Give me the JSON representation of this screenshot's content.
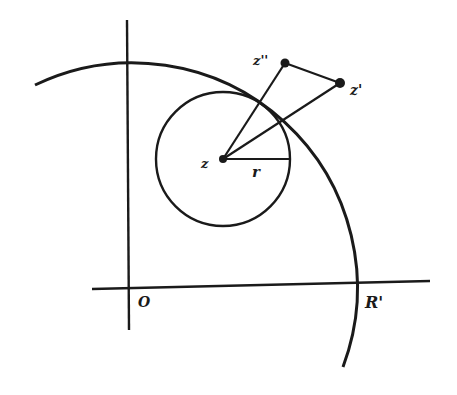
{
  "diagram": {
    "labels": {
      "z": "z",
      "z_prime": "z'",
      "z_double_prime": "z''",
      "r": "r",
      "origin": "O",
      "R_prime": "R'"
    },
    "elements": {
      "axes": "horizontal and vertical coordinate axes through O",
      "large_arc": "arc of circle of radius R' centered at O",
      "small_circle": "circle of radius r centered at z",
      "segments": [
        "z to z''",
        "z to z'",
        "z'' to z'",
        "z to right edge of small circle (radius r)"
      ]
    },
    "colors": {
      "ink": "#1a1a1a",
      "background": "#ffffff"
    }
  }
}
